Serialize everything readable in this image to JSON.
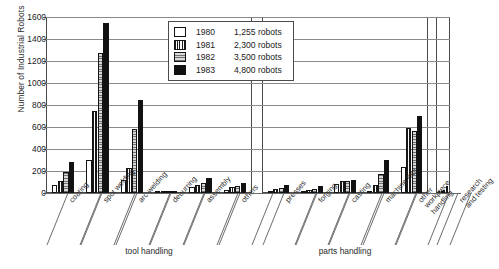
{
  "chart_data": {
    "type": "bar",
    "title": "",
    "xlabel": "",
    "ylabel": "Number of Industrial Robots",
    "ylim": [
      0,
      1600
    ],
    "yticks": [
      0,
      200,
      400,
      600,
      800,
      1000,
      1200,
      1400,
      1600
    ],
    "grid": true,
    "legend_position": "top-center",
    "legend_note_suffix": "robots",
    "categories": [
      "coating",
      "spot welding",
      "arc welding",
      "deburring",
      "assembly",
      "others",
      "presses",
      "forging",
      "casting",
      "machine tool",
      "other\nworkpiece\nhandling",
      "research\nand testing"
    ],
    "groups": [
      {
        "label": "tool handling",
        "categories": [
          "coating",
          "spot welding",
          "arc welding",
          "deburring",
          "assembly",
          "others"
        ]
      },
      {
        "label": "parts handling",
        "categories": [
          "presses",
          "forging",
          "casting",
          "machine tool",
          "other workpiece handling"
        ]
      },
      {
        "label": "",
        "categories": [
          "research and testing"
        ]
      }
    ],
    "series": [
      {
        "name": "1980",
        "total": "1,255 robots",
        "swatch": "white",
        "values": [
          75,
          300,
          120,
          10,
          55,
          30,
          15,
          10,
          80,
          20,
          235,
          8
        ]
      },
      {
        "name": "1981",
        "total": "2,300 robots",
        "swatch": "vertical-hatch",
        "values": [
          110,
          750,
          230,
          15,
          75,
          55,
          35,
          25,
          105,
          70,
          595,
          18
        ]
      },
      {
        "name": "1982",
        "total": "3,500 robots",
        "swatch": "horizontal-hatch",
        "values": [
          195,
          1270,
          580,
          18,
          90,
          60,
          50,
          35,
          110,
          175,
          560,
          30
        ]
      },
      {
        "name": "1983",
        "total": "4,800 robots",
        "swatch": "black",
        "values": [
          285,
          1550,
          845,
          22,
          135,
          95,
          75,
          60,
          120,
          300,
          700,
          60
        ]
      }
    ]
  },
  "legend": {
    "rows": [
      {
        "year": "1980",
        "count": "1,255 robots"
      },
      {
        "year": "1981",
        "count": "2,300 robots"
      },
      {
        "year": "1982",
        "count": "3,500 robots"
      },
      {
        "year": "1983",
        "count": "4,800 robots"
      }
    ]
  },
  "axes": {
    "y_title": "Number of Industrial Robots",
    "y_ticks": [
      "1600",
      "1400",
      "1200",
      "1000",
      "800",
      "600",
      "400",
      "200",
      "0"
    ]
  },
  "group_captions": {
    "tool_handling": "tool handling",
    "parts_handling": "parts handling"
  }
}
